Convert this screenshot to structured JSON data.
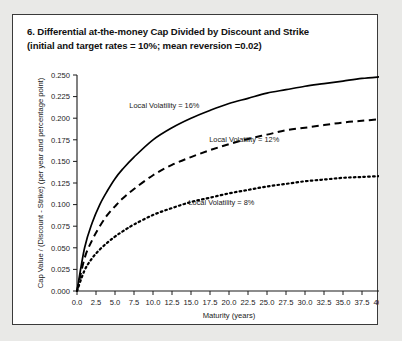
{
  "figure": {
    "title_lines": [
      "6. Differential at-the-money Cap Divided by Discount and Strike",
      "(initial and target rates = 10%; mean reversion =0.02)"
    ]
  },
  "chart_data": {
    "type": "line",
    "title": "6. Differential at-the-money Cap Divided by Discount and Strike (initial and target rates = 10%; mean reversion =0.02)",
    "xlabel": "Maturity (years)",
    "ylabel": "Cap Value / (Discount - Strike) (per year and percentage point)",
    "xlim": [
      0.0,
      40.0
    ],
    "ylim": [
      0.0,
      0.25
    ],
    "xticks": [
      0.0,
      2.5,
      5.0,
      7.5,
      10.0,
      12.5,
      15.0,
      17.5,
      20.0,
      22.5,
      25.0,
      27.5,
      30.0,
      32.5,
      35.0,
      37.5,
      40.0
    ],
    "xtick_labels": [
      "0.0",
      "2.5",
      "5.0",
      "7.5",
      "10.0",
      "12.5",
      "15.0",
      "17.5",
      "20.0",
      "22.5",
      "25.0",
      "27.5",
      "30.0",
      "32.5",
      "35.0",
      "37.5",
      "40.0"
    ],
    "yticks": [
      0.0,
      0.025,
      0.05,
      0.075,
      0.1,
      0.125,
      0.15,
      0.175,
      0.2,
      0.225,
      0.25
    ],
    "ytick_labels": [
      "0.000",
      "0.025",
      "0.050",
      "0.075",
      "0.100",
      "0.125",
      "0.150",
      "0.175",
      "0.200",
      "0.225",
      "0.250"
    ],
    "grid": false,
    "legend": "inline-annotations",
    "x": [
      0.0,
      1.0,
      2.0,
      3.0,
      4.0,
      5.0,
      6.0,
      7.5,
      10.0,
      12.5,
      15.0,
      17.5,
      20.0,
      22.5,
      25.0,
      27.5,
      30.0,
      32.5,
      35.0,
      37.5,
      40.0
    ],
    "series": [
      {
        "name": "Local Volatility = 16%",
        "style": "solid",
        "label_x": 11.5,
        "label_y": 0.212,
        "values": [
          0.0,
          0.05,
          0.079,
          0.1,
          0.116,
          0.13,
          0.141,
          0.155,
          0.175,
          0.189,
          0.2,
          0.209,
          0.217,
          0.223,
          0.229,
          0.233,
          0.237,
          0.24,
          0.243,
          0.246,
          0.248
        ]
      },
      {
        "name": "Local Volatility = 12%",
        "style": "dashed",
        "label_x": 22.0,
        "label_y": 0.172,
        "values": [
          0.0,
          0.038,
          0.059,
          0.075,
          0.088,
          0.098,
          0.107,
          0.118,
          0.134,
          0.146,
          0.155,
          0.163,
          0.17,
          0.176,
          0.181,
          0.186,
          0.189,
          0.192,
          0.195,
          0.197,
          0.199
        ]
      },
      {
        "name": "Local Volatility = 8%",
        "style": "dotted",
        "label_x": 19.0,
        "label_y": 0.099,
        "values": [
          0.0,
          0.024,
          0.038,
          0.048,
          0.056,
          0.063,
          0.069,
          0.077,
          0.088,
          0.096,
          0.103,
          0.108,
          0.113,
          0.117,
          0.121,
          0.124,
          0.127,
          0.129,
          0.131,
          0.132,
          0.133
        ]
      }
    ]
  }
}
